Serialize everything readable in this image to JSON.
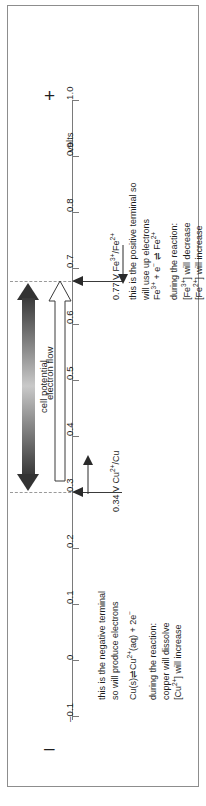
{
  "diagram": {
    "axis": {
      "unit_label": "volts",
      "positive_end_symbol": "+",
      "negative_end_symbol": "–",
      "tick_labels": [
        "1.0",
        "0.9",
        "0.8",
        "0.7",
        "0.6",
        "0.5",
        "0.4",
        "0.3",
        "0.2",
        "0.1",
        "0",
        "–0.1"
      ],
      "tick_values": [
        1.0,
        0.9,
        0.8,
        0.7,
        0.6,
        0.5,
        0.4,
        0.3,
        0.2,
        0.1,
        0,
        -0.1
      ],
      "min": -0.1,
      "max": 1.0
    },
    "cell_potential": {
      "label": "cell potential",
      "from_value": "0.34",
      "to_value": "0.77"
    },
    "electron_flow": {
      "label": "electron flow"
    },
    "electrodes": [
      {
        "id": "cathode",
        "potential": "0.77 V",
        "couple": "Fe3+/Fe2+",
        "couple_html": "Fe<sup>3+</sup>/Fe<sup>2+</sup>",
        "value": 0.77
      },
      {
        "id": "anode",
        "potential": "0.34 V",
        "couple": "Cu2+/Cu",
        "couple_html": "Cu<sup>2+</sup>/Cu",
        "value": 0.34
      }
    ],
    "annotations": {
      "positive": {
        "terminal_line1": "this is the positive terminal so",
        "terminal_line2": "will use up electrons",
        "equation": "Fe3+ + e− ⇌ Fe2+",
        "equation_html": "Fe<sup>3+</sup> + e<sup>−</sup> ⇌ Fe<sup>2+</sup>",
        "during_line1": "during the reaction:",
        "during_line2": "[Fe3+] will decrease",
        "during_line2_html": "[Fe<sup>3+</sup>] will decrease",
        "during_line3": "[Fe2+] will increase",
        "during_line3_html": "[Fe<sup>2+</sup>] will increase"
      },
      "negative": {
        "terminal_line1": "this is the negative terminal",
        "terminal_line2": "so will produce electrons",
        "equation": "Cu(s) ⇌ Cu2+(aq) + 2e−",
        "equation_html": "Cu(s)⇌Cu<sup>2+</sup>(aq) + 2e<sup>−</sup>",
        "during_line1": "during the reaction:",
        "during_line2": "copper will dissolve",
        "during_line3": "[Cu2+] will increase",
        "during_line3_html": "[Cu<sup>2+</sup>] will increase"
      }
    },
    "colors": {
      "axis": "#7a7a7a",
      "arrow": "#333333",
      "dashed": "#9a9a9a",
      "text": "#1f1f1f",
      "border": "#8d8d8d"
    }
  }
}
